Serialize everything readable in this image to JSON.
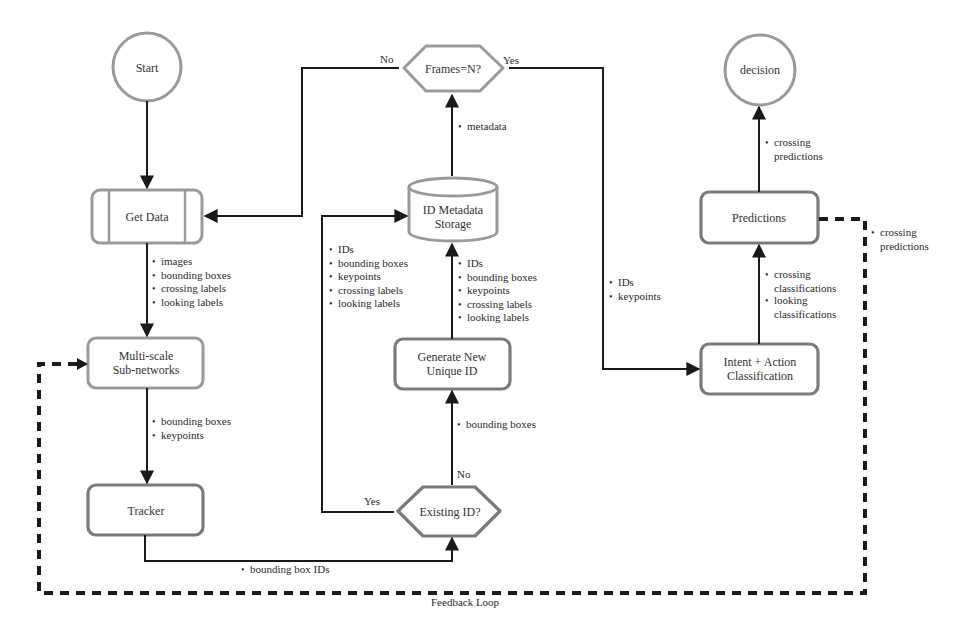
{
  "diagram": {
    "type": "flowchart",
    "nodes": {
      "start": {
        "label": "Start",
        "shape": "circle"
      },
      "get_data": {
        "label": "Get Data",
        "shape": "predefined-process"
      },
      "multiscale": {
        "line1": "Multi-scale",
        "line2": "Sub-networks",
        "shape": "rounded-rect"
      },
      "tracker": {
        "label": "Tracker",
        "shape": "rounded-rect"
      },
      "existing_id": {
        "label": "Existing ID?",
        "shape": "diamond"
      },
      "generate_id": {
        "line1": "Generate New",
        "line2": "Unique ID",
        "shape": "rounded-rect"
      },
      "storage": {
        "line1": "ID Metadata",
        "line2": "Storage",
        "shape": "cylinder"
      },
      "frames": {
        "label": "Frames=N?",
        "shape": "diamond"
      },
      "intent": {
        "line1": "Intent + Action",
        "line2": "Classification",
        "shape": "rounded-rect"
      },
      "predictions": {
        "label": "Predictions",
        "shape": "rounded-rect"
      },
      "decision": {
        "label": "decision",
        "shape": "circle"
      }
    },
    "edges": {
      "getdata_to_multiscale": [
        "images",
        "bounding boxes",
        "crossing labels",
        "looking labels"
      ],
      "multiscale_to_tracker": [
        "bounding boxes",
        "keypoints"
      ],
      "tracker_to_existing": [
        "bounding box IDs"
      ],
      "existing_no_to_generate": [
        "bounding boxes"
      ],
      "existing_yes_to_storage": [
        "IDs",
        "bounding boxes",
        "keypoints",
        "crossing labels",
        "looking labels"
      ],
      "generate_to_storage": [
        "IDs",
        "bounding boxes",
        "keypoints",
        "crossing labels",
        "looking labels"
      ],
      "storage_to_frames": [
        "metadata"
      ],
      "frames_yes_to_intent": [
        "IDs",
        "keypoints"
      ],
      "intent_to_predictions": [
        [
          "crossing",
          "classifications"
        ],
        [
          "looking",
          "classifications"
        ]
      ],
      "predictions_to_decision": [
        [
          "crossing",
          "predictions"
        ]
      ],
      "feedback": [
        [
          "crossing",
          "predictions"
        ]
      ]
    },
    "branch_labels": {
      "frames_no": "No",
      "frames_yes": "Yes",
      "existing_yes": "Yes",
      "existing_no": "No"
    },
    "feedback_label": "Feedback Loop"
  }
}
